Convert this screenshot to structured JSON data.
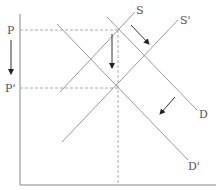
{
  "diagram": {
    "type": "supply-demand",
    "labels": {
      "P": "P",
      "P_prime": "P'",
      "S": "S",
      "S_prime": "S'",
      "D": "D",
      "D_prime": "D'"
    },
    "colors": {
      "axis": "#888888",
      "curve": "#999999",
      "dashed": "#aaaaaa",
      "arrow": "#333333",
      "text": "#555555"
    }
  }
}
